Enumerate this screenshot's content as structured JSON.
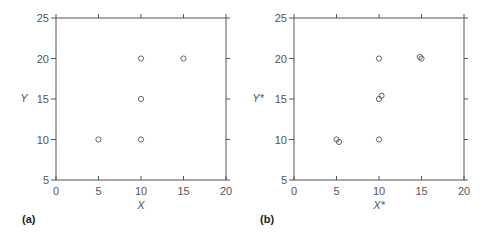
{
  "chart_data": [
    {
      "type": "scatter",
      "panel_label": "(a)",
      "xlabel": "X",
      "ylabel": "Y",
      "xlim": [
        0,
        20
      ],
      "ylim": [
        5,
        25
      ],
      "xticks": [
        0,
        5,
        10,
        15,
        20
      ],
      "yticks": [
        5,
        10,
        15,
        20,
        25
      ],
      "grid": false,
      "points": [
        {
          "x": 5,
          "y": 10
        },
        {
          "x": 10,
          "y": 10
        },
        {
          "x": 10,
          "y": 15
        },
        {
          "x": 10,
          "y": 20
        },
        {
          "x": 15,
          "y": 20
        }
      ]
    },
    {
      "type": "scatter",
      "panel_label": "(b)",
      "xlabel": "X*",
      "ylabel": "Y*",
      "xlim": [
        0,
        20
      ],
      "ylim": [
        5,
        25
      ],
      "xticks": [
        0,
        5,
        10,
        15,
        20
      ],
      "yticks": [
        5,
        10,
        15,
        20,
        25
      ],
      "grid": false,
      "points": [
        {
          "x": 5,
          "y": 10
        },
        {
          "x": 5.3,
          "y": 9.7
        },
        {
          "x": 10,
          "y": 10
        },
        {
          "x": 10,
          "y": 15
        },
        {
          "x": 10.3,
          "y": 15.4
        },
        {
          "x": 10,
          "y": 20
        },
        {
          "x": 14.8,
          "y": 20.2
        },
        {
          "x": 15,
          "y": 20
        }
      ]
    }
  ]
}
